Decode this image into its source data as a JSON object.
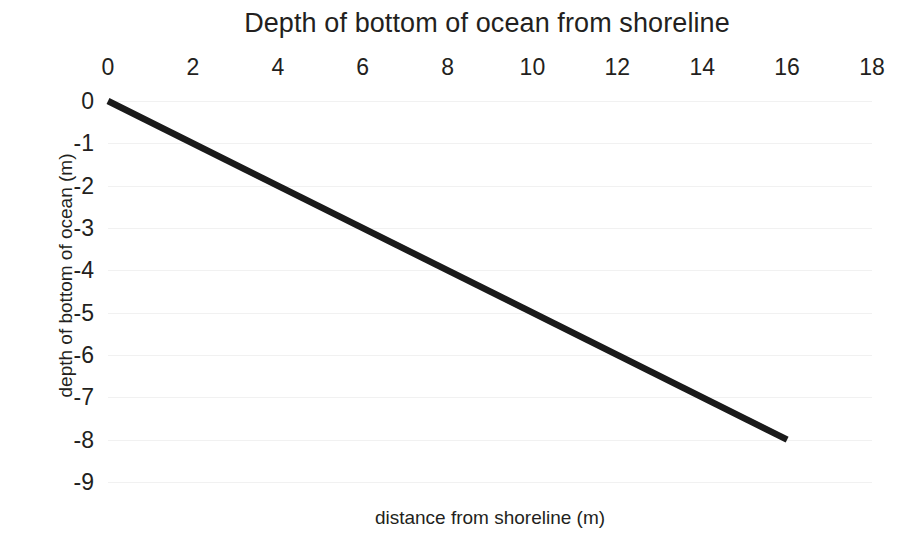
{
  "chart_data": {
    "type": "line",
    "title": "Depth of bottom of ocean from shoreline",
    "xlabel": "distance from shoreline (m)",
    "ylabel": "depth of bottom of ocean (m)",
    "xlim": [
      0,
      18
    ],
    "ylim": [
      -9,
      0
    ],
    "grid": true,
    "grid_axis": "y",
    "legend": "none",
    "x_axis_position": "top",
    "xticks": [
      0,
      2,
      4,
      6,
      8,
      10,
      12,
      14,
      16,
      18
    ],
    "xtick_labels": [
      "0",
      "2",
      "4",
      "6",
      "8",
      "10",
      "12",
      "14",
      "16",
      "18"
    ],
    "yticks": [
      0,
      -1,
      -2,
      -3,
      -4,
      -5,
      -6,
      -7,
      -8,
      -9
    ],
    "ytick_labels": [
      "0",
      "-1",
      "-2",
      "-3",
      "-4",
      "-5",
      "-6",
      "-7",
      "-8",
      "-9"
    ],
    "series": [
      {
        "name": "ocean bottom",
        "color": "#1a1a1a",
        "line_width": 6.5,
        "x": [
          0,
          16
        ],
        "y": [
          0,
          -8
        ],
        "slope": -0.5,
        "intercept": 0
      }
    ]
  },
  "colors": {
    "background": "#ffffff",
    "text": "#231f20",
    "gridline": "#f1f1f1",
    "series": "#1a1a1a"
  }
}
